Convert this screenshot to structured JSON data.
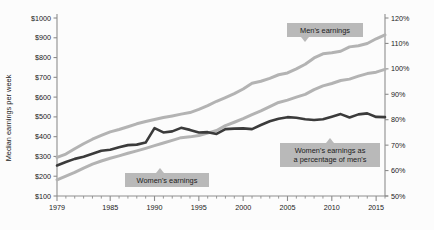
{
  "chart_data": {
    "type": "line",
    "title": "",
    "xlabel": "",
    "ylabel": "Median earnings per week",
    "ylabel_right": "",
    "xlim": [
      1979,
      2016
    ],
    "ylim": [
      100,
      1000
    ],
    "ylim_right": [
      50,
      120
    ],
    "grid": false,
    "legend_position": "inline-callouts",
    "x": [
      1979,
      1980,
      1981,
      1982,
      1983,
      1984,
      1985,
      1986,
      1987,
      1988,
      1989,
      1990,
      1991,
      1992,
      1993,
      1994,
      1995,
      1996,
      1997,
      1998,
      1999,
      2000,
      2001,
      2002,
      2003,
      2004,
      2005,
      2006,
      2007,
      2008,
      2009,
      2010,
      2011,
      2012,
      2013,
      2014,
      2015,
      2016
    ],
    "x_tick_labels": [
      "1979",
      "1985",
      "1990",
      "1995",
      "2000",
      "2005",
      "2010",
      "2015"
    ],
    "x_ticks": [
      1979,
      1985,
      1990,
      1995,
      2000,
      2005,
      2010,
      2015
    ],
    "y_tick_labels": [
      "$100",
      "$200",
      "$300",
      "$400",
      "$500",
      "$600",
      "$700",
      "$800",
      "$900",
      "$1000"
    ],
    "y_ticks": [
      100,
      200,
      300,
      400,
      500,
      600,
      700,
      800,
      900,
      1000
    ],
    "y_right_tick_labels": [
      "50%",
      "60%",
      "70%",
      "80%",
      "90%",
      "100%",
      "110%",
      "120%"
    ],
    "y_right_ticks": [
      50,
      60,
      70,
      80,
      90,
      100,
      110,
      120
    ],
    "series": [
      {
        "name": "Men's earnings",
        "axis": "left",
        "color": "#b3b3b3",
        "width": 3.0,
        "values": [
          295,
          312,
          339,
          364,
          387,
          406,
          424,
          436,
          450,
          465,
          477,
          487,
          497,
          505,
          514,
          522,
          538,
          557,
          579,
          598,
          618,
          641,
          670,
          680,
          695,
          713,
          722,
          743,
          766,
          798,
          819,
          824,
          832,
          854,
          860,
          871,
          895,
          915
        ]
      },
      {
        "name": "Women's earnings",
        "axis": "left",
        "color": "#b3b3b3",
        "width": 3.0,
        "values": [
          182,
          201,
          219,
          241,
          261,
          277,
          291,
          303,
          316,
          328,
          341,
          355,
          368,
          381,
          395,
          399,
          406,
          418,
          431,
          456,
          473,
          491,
          511,
          530,
          552,
          573,
          585,
          600,
          614,
          638,
          657,
          669,
          684,
          691,
          706,
          719,
          726,
          740
        ]
      },
      {
        "name": "Women's earnings as a percentage of men's",
        "axis": "right",
        "color": "#3b3b3b",
        "width": 2.6,
        "values": [
          62.0,
          63.4,
          64.6,
          65.4,
          66.6,
          67.8,
          68.2,
          69.2,
          70.0,
          70.2,
          71.0,
          76.7,
          75.0,
          75.4,
          76.8,
          76.0,
          75.0,
          75.1,
          74.4,
          76.3,
          76.5,
          76.6,
          76.3,
          77.9,
          79.4,
          80.4,
          81.0,
          80.8,
          80.2,
          79.9,
          80.2,
          81.2,
          82.2,
          80.9,
          82.1,
          82.5,
          81.1,
          81.0
        ]
      }
    ],
    "annotations": [
      {
        "label": "Men's earnings",
        "lines": [
          "Men's earnings"
        ],
        "pointer": "down"
      },
      {
        "label": "Women's earnings",
        "lines": [
          "Women's earnings"
        ],
        "pointer": "up"
      },
      {
        "label": "Women's earnings as a percentage of men's",
        "lines": [
          "Women's earnings as",
          "a percentage of men's"
        ],
        "pointer": "up"
      }
    ],
    "colors": {
      "background": "#fcfcfc",
      "light_series": "#b3b3b3",
      "dark_series": "#3b3b3b",
      "callout_background": "#b9b9b9",
      "axis": "#8d8d8d",
      "text": "#1a1a1a"
    }
  }
}
